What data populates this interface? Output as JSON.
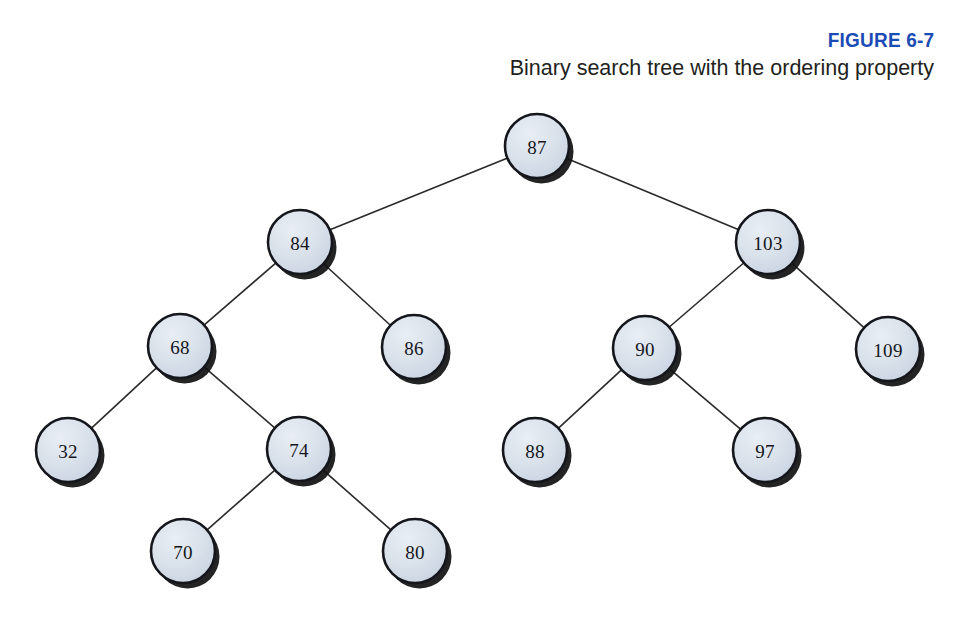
{
  "figure": {
    "number_label": "FIGURE 6-7",
    "caption": "Binary search tree with the ordering property",
    "accent_color": "#1b4bb5",
    "caption_color": "#231f20"
  },
  "style": {
    "node_fill": "#d2dae6",
    "node_fill_highlight": "#e8edf4",
    "node_stroke": "#14161c",
    "edge_color": "#2a2a2a",
    "shadow_color": "#111111",
    "background": "#ffffff",
    "node_radius": 32
  },
  "chart_data": {
    "type": "diagram",
    "diagram_kind": "binary-search-tree",
    "title": "Binary search tree with the ordering property",
    "node_radius": 32,
    "nodes": [
      {
        "id": "n87",
        "value": "87",
        "x": 537,
        "y": 146,
        "level": 0
      },
      {
        "id": "n84",
        "value": "84",
        "x": 300,
        "y": 242,
        "level": 1
      },
      {
        "id": "n103",
        "value": "103",
        "x": 768,
        "y": 242,
        "level": 1
      },
      {
        "id": "n68",
        "value": "68",
        "x": 180,
        "y": 346,
        "level": 2
      },
      {
        "id": "n86",
        "value": "86",
        "x": 414,
        "y": 347,
        "level": 2
      },
      {
        "id": "n90",
        "value": "90",
        "x": 645,
        "y": 348,
        "level": 2
      },
      {
        "id": "n109",
        "value": "109",
        "x": 888,
        "y": 349,
        "level": 2
      },
      {
        "id": "n32",
        "value": "32",
        "x": 68,
        "y": 450,
        "level": 3
      },
      {
        "id": "n74",
        "value": "74",
        "x": 299,
        "y": 449,
        "level": 3
      },
      {
        "id": "n88",
        "value": "88",
        "x": 535,
        "y": 450,
        "level": 3
      },
      {
        "id": "n97",
        "value": "97",
        "x": 765,
        "y": 450,
        "level": 3
      },
      {
        "id": "n70",
        "value": "70",
        "x": 183,
        "y": 551,
        "level": 4
      },
      {
        "id": "n80",
        "value": "80",
        "x": 415,
        "y": 551,
        "level": 4
      }
    ],
    "edges": [
      {
        "from": "n87",
        "to": "n84",
        "side": "left"
      },
      {
        "from": "n87",
        "to": "n103",
        "side": "right"
      },
      {
        "from": "n84",
        "to": "n68",
        "side": "left"
      },
      {
        "from": "n84",
        "to": "n86",
        "side": "right"
      },
      {
        "from": "n103",
        "to": "n90",
        "side": "left"
      },
      {
        "from": "n103",
        "to": "n109",
        "side": "right"
      },
      {
        "from": "n68",
        "to": "n32",
        "side": "left"
      },
      {
        "from": "n68",
        "to": "n74",
        "side": "right"
      },
      {
        "from": "n90",
        "to": "n88",
        "side": "left"
      },
      {
        "from": "n90",
        "to": "n97",
        "side": "right"
      },
      {
        "from": "n74",
        "to": "n70",
        "side": "left"
      },
      {
        "from": "n74",
        "to": "n80",
        "side": "right"
      }
    ]
  }
}
